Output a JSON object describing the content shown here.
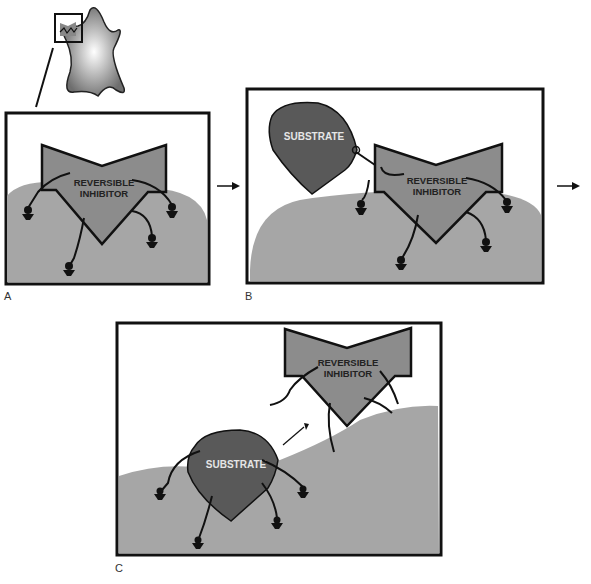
{
  "figure": {
    "panels": [
      {
        "id": "A",
        "label": "A",
        "inhibitor_text": [
          "REVERSIBLE",
          "INHIBITOR"
        ]
      },
      {
        "id": "B",
        "label": "B",
        "inhibitor_text": [
          "REVERSIBLE",
          "INHIBITOR"
        ],
        "substrate_text": "SUBSTRATE"
      },
      {
        "id": "C",
        "label": "C",
        "inhibitor_text": [
          "REVERSIBLE",
          "INHIBITOR"
        ],
        "substrate_text": "SUBSTRATE"
      }
    ],
    "icons": [
      "cell-icon",
      "arrow-right-icon",
      "arrow-diagonal-icon"
    ],
    "colors": {
      "cell_surface": "#a6a6a6",
      "inhibitor_fill": "#8c8c8c",
      "substrate_fill": "#595959",
      "outline": "#111111",
      "background": "#ffffff"
    }
  }
}
